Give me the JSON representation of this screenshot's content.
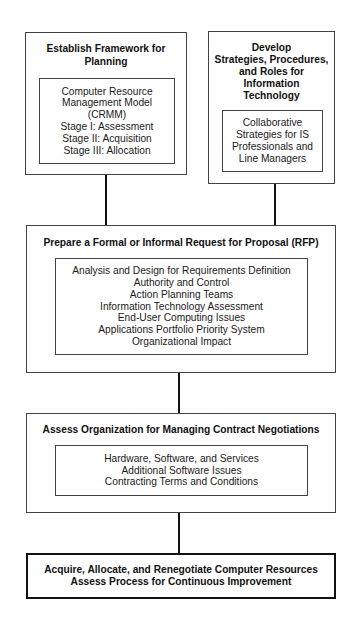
{
  "diagram": {
    "type": "flowchart",
    "boxes": {
      "framework": {
        "title_lines": [
          "Establish Framework for",
          "Planning"
        ],
        "items": [
          "Computer Resource",
          "Management Model",
          "(CRMM)",
          "Stage I: Assessment",
          "Stage II: Acquisition",
          "Stage III: Allocation"
        ]
      },
      "strategies": {
        "title_lines": [
          "Develop",
          "Strategies, Procedures,",
          "and Roles for",
          "Information",
          "Technology"
        ],
        "items": [
          "Collaborative",
          "Strategies for IS",
          "Professionals and",
          "Line Managers"
        ]
      },
      "rfp": {
        "title": "Prepare a Formal or Informal Request for Proposal (RFP)",
        "items": [
          "Analysis and Design for Requirements Definition",
          "Authority and Control",
          "Action Planning Teams",
          "Information Technology Assessment",
          "End-User Computing Issues",
          "Applications Portfolio Priority System",
          "Organizational Impact"
        ]
      },
      "negotiations": {
        "title": "Assess Organization for Managing Contract Negotiations",
        "items": [
          "Hardware, Software, and Services",
          "Additional Software Issues",
          "Contracting Terms and Conditions"
        ]
      },
      "final": {
        "lines": [
          "Acquire, Allocate, and Renegotiate Computer Resources",
          "Assess Process for Continuous Improvement"
        ]
      }
    },
    "edges": [
      {
        "from": "framework",
        "to": "rfp"
      },
      {
        "from": "strategies",
        "to": "rfp"
      },
      {
        "from": "rfp",
        "to": "negotiations"
      },
      {
        "from": "negotiations",
        "to": "final"
      }
    ]
  }
}
